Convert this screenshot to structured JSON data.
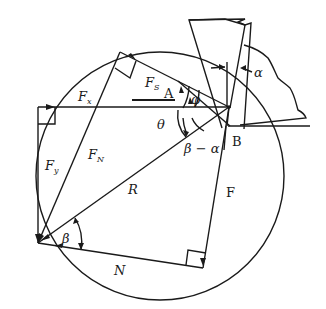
{
  "diagram": {
    "colors": {
      "stroke": "#1a1a1a",
      "background": "#ffffff"
    },
    "labels": {
      "Fx": {
        "main": "F",
        "sub": "x"
      },
      "Fy": {
        "main": "F",
        "sub": "y"
      },
      "FN": {
        "main": "F",
        "sub": "N"
      },
      "Fs": {
        "main": "F",
        "sub": "S"
      },
      "R": "R",
      "F": "F",
      "N": "N",
      "A": "A",
      "B": "B",
      "phi": "φ",
      "theta": "θ",
      "beta": "β",
      "beta_minus_alpha": "β − α",
      "alpha": "α"
    },
    "elements": [
      "force-circle",
      "tool",
      "workpiece-chip",
      "shear-plane",
      "resultant-R",
      "friction-force-F",
      "normal-force-N",
      "shear-force-Fs",
      "normal-shear-force-FN",
      "cutting-force-Fx",
      "thrust-force-Fy"
    ]
  }
}
